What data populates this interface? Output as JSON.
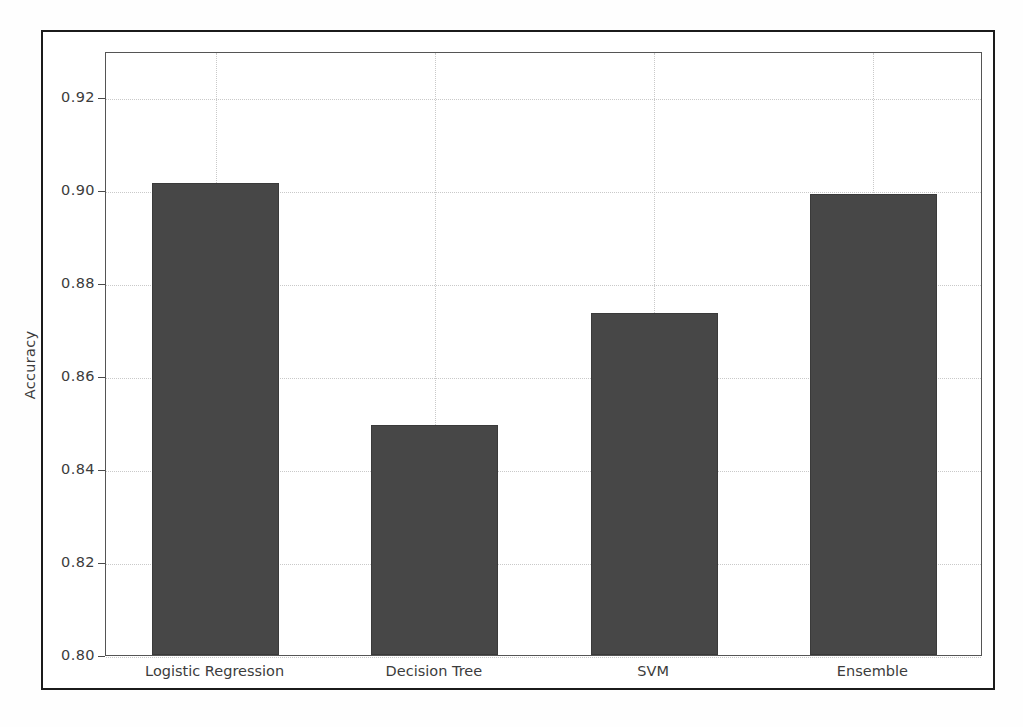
{
  "chart_data": {
    "type": "bar",
    "title": "",
    "xlabel": "",
    "ylabel": "Accuracy",
    "categories": [
      "Logistic Regression",
      "Decision Tree",
      "SVM",
      "Ensemble"
    ],
    "values": [
      0.9017,
      0.8494,
      0.8737,
      0.8993
    ],
    "ylim": [
      0.8,
      0.93
    ],
    "yticks": [
      "0.80",
      "0.82",
      "0.84",
      "0.86",
      "0.88",
      "0.90",
      "0.92"
    ],
    "ytick_values": [
      0.8,
      0.82,
      0.84,
      0.86,
      0.88,
      0.9,
      0.92
    ],
    "grid": true,
    "grid_style": "dotted",
    "legend": null,
    "bar_color": "#474747",
    "bar_edge_color": "#3a3a3a",
    "grid_color": "#c9c9c9",
    "axes_color": "#555555",
    "frame_color": "#1b1b1b",
    "background": "#ffffff"
  }
}
